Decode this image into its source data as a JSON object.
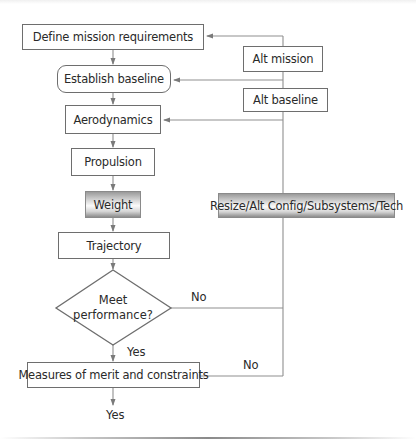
{
  "diagram": {
    "type": "flowchart",
    "colors": {
      "line": "#8a8a8a",
      "border": "#6e6e6e",
      "text": "#2a2a2a",
      "shade_dark": "#8c8c8c",
      "shade_light": "#fafafa"
    },
    "nodes": {
      "define": {
        "label": "Define mission requirements",
        "shape": "rect"
      },
      "establish": {
        "label": "Establish baseline",
        "shape": "rounded-rect"
      },
      "aero": {
        "label": "Aerodynamics",
        "shape": "rect"
      },
      "propulsion": {
        "label": "Propulsion",
        "shape": "rect"
      },
      "weight": {
        "label": "Weight",
        "shape": "shaded-rect"
      },
      "trajectory": {
        "label": "Trajectory",
        "shape": "rect"
      },
      "meet_line1": {
        "label": "Meet"
      },
      "meet_line2": {
        "label": "performance?"
      },
      "measures": {
        "label": "Measures of merit and constraints",
        "shape": "rect"
      },
      "alt_mission": {
        "label": "Alt mission",
        "shape": "rect"
      },
      "alt_baseline": {
        "label": "Alt baseline",
        "shape": "rect"
      },
      "resize": {
        "label": "Resize/Alt Config/Subsystems/Tech",
        "shape": "shaded-rect"
      }
    },
    "edge_labels": {
      "meet_no": "No",
      "meet_yes": "Yes",
      "measures_no": "No",
      "measures_yes": "Yes"
    },
    "edges": [
      {
        "from": "define",
        "to": "establish"
      },
      {
        "from": "establish",
        "to": "aero"
      },
      {
        "from": "aero",
        "to": "propulsion"
      },
      {
        "from": "propulsion",
        "to": "weight"
      },
      {
        "from": "weight",
        "to": "trajectory"
      },
      {
        "from": "trajectory",
        "to": "meet_performance"
      },
      {
        "from": "meet_performance",
        "to": "measures",
        "label": "Yes"
      },
      {
        "from": "meet_performance",
        "to": "feedback_loop",
        "label": "No"
      },
      {
        "from": "measures",
        "to": "feedback_loop",
        "label": "No"
      },
      {
        "from": "measures",
        "to": "exit",
        "label": "Yes"
      },
      {
        "from": "feedback_loop",
        "to": "define",
        "via": "Alt mission"
      },
      {
        "from": "feedback_loop",
        "to": "establish",
        "via": "Alt baseline"
      },
      {
        "from": "feedback_loop",
        "to": "aero",
        "via": "Resize/Alt Config/Subsystems/Tech"
      }
    ]
  }
}
